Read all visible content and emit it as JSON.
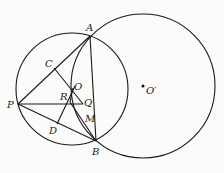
{
  "diagram": {
    "type": "geometry",
    "stroke_color": "#1a1a1a",
    "background": "#fbfbf9",
    "circles": [
      {
        "name": "circle-O",
        "cx": 72,
        "cy": 89,
        "r": 56
      },
      {
        "name": "circle-O-prime",
        "cx": 143,
        "cy": 86,
        "r": 72
      }
    ],
    "points": {
      "A": {
        "x": 90,
        "y": 36,
        "label": "A",
        "lx": 86,
        "ly": 31
      },
      "B": {
        "x": 96,
        "y": 141,
        "label": "B",
        "lx": 92,
        "ly": 154
      },
      "P": {
        "x": 18,
        "y": 104,
        "label": "P",
        "lx": 7,
        "ly": 108
      },
      "C": {
        "x": 54,
        "y": 68,
        "label": "C",
        "lx": 45,
        "ly": 67
      },
      "O": {
        "x": 73,
        "y": 88,
        "label": "O",
        "lx": 74,
        "ly": 89
      },
      "R": {
        "x": 70,
        "y": 102,
        "label": "R",
        "lx": 61,
        "ly": 100
      },
      "Q": {
        "x": 83,
        "y": 104,
        "label": "Q",
        "lx": 85,
        "ly": 106
      },
      "M": {
        "x": 85,
        "y": 118,
        "label": "M",
        "lx": 86,
        "ly": 122
      },
      "D": {
        "x": 57,
        "y": 124,
        "label": "D",
        "lx": 50,
        "ly": 133
      },
      "O_prime": {
        "x": 143,
        "y": 86,
        "label": "O′",
        "lx": 146,
        "ly": 93
      }
    },
    "segments": [
      [
        "P",
        "A"
      ],
      [
        "P",
        "Q"
      ],
      [
        "P",
        "B"
      ],
      [
        "C",
        "Q"
      ],
      [
        "A",
        "B"
      ],
      [
        "D",
        "O"
      ],
      [
        "R",
        "M"
      ],
      [
        "R",
        "Q"
      ]
    ]
  }
}
